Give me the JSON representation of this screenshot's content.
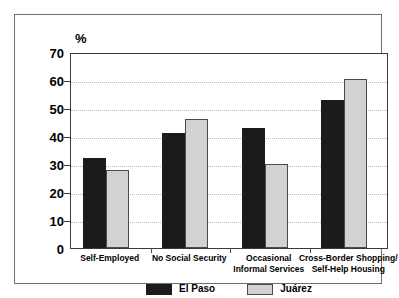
{
  "chart_data": {
    "type": "bar",
    "title": "",
    "subtitle": "",
    "xlabel": "",
    "ylabel": "%",
    "ylim": [
      0,
      70
    ],
    "ytick_step": 10,
    "yticks": [
      70,
      60,
      50,
      40,
      30,
      20,
      10,
      0
    ],
    "ytick_labels": [
      "70",
      "60",
      "50",
      "40",
      "30",
      "20",
      "10",
      "0"
    ],
    "grid": true,
    "grid_axis": "y",
    "grid_style": "dotted",
    "legend_position": "bottom-center",
    "categories": [
      "Self-Employed",
      "No Social Security",
      "Occasional Informal Services",
      "Cross-Border Shopping/Self-Help Housing"
    ],
    "category_label_lines": [
      [
        "Self-Employed"
      ],
      [
        "No Social Security"
      ],
      [
        "Occasional",
        "Informal Services"
      ],
      [
        "Cross-Border Shopping/",
        "Self-Help Housing"
      ]
    ],
    "series": [
      {
        "name": "El Paso",
        "color": "#1b1b1b",
        "values": [
          32,
          41,
          43,
          53
        ]
      },
      {
        "name": "Juárez",
        "color": "#d2d2d2",
        "values": [
          28,
          46,
          30,
          60.5
        ]
      }
    ]
  },
  "axis": {
    "unit_label": "%"
  },
  "legend": {
    "items": [
      {
        "label": "El Paso",
        "swatch": "series-a"
      },
      {
        "label": "Juárez",
        "swatch": "series-b"
      }
    ]
  },
  "colors": {
    "series_a": "#1b1b1b",
    "series_b": "#d2d2d2",
    "series_b_outline": "#4a4a4a",
    "gridline": "#b9b9b9",
    "axis": "#3a3a3a",
    "frame": "#6e6e6e",
    "background": "#ffffff",
    "text": "#000000"
  }
}
